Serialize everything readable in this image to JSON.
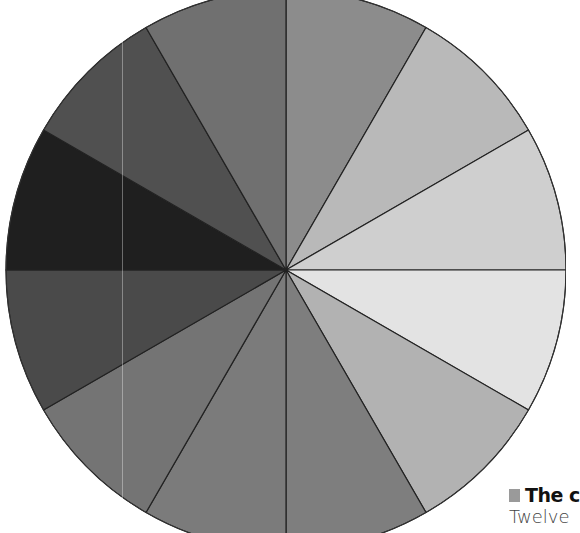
{
  "chart_data": {
    "type": "pie",
    "title": "",
    "center": [
      286,
      270
    ],
    "radius": 280,
    "start_angle_deg": 90,
    "direction": "clockwise",
    "categories": [
      "Segment 1",
      "Segment 2",
      "Segment 3",
      "Segment 4",
      "Segment 5",
      "Segment 6",
      "Segment 7",
      "Segment 8",
      "Segment 9",
      "Segment 10",
      "Segment 11",
      "Segment 12"
    ],
    "values": [
      1,
      1,
      1,
      1,
      1,
      1,
      1,
      1,
      1,
      1,
      1,
      1
    ],
    "colors": [
      "#8c8c8c",
      "#b9b9b9",
      "#cfcfcf",
      "#e3e3e3",
      "#b2b2b2",
      "#7e7e7e",
      "#7b7b7b",
      "#747474",
      "#4a4a4a",
      "#1f1f1f",
      "#505050",
      "#707070"
    ],
    "stroke_color": "#222222",
    "legend": "none",
    "grid": false
  },
  "caption": {
    "title": "The c",
    "body": "Twelve",
    "marker_color": "#9a9a9a"
  }
}
